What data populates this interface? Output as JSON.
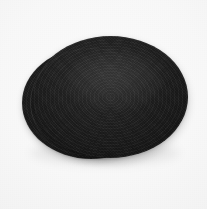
{
  "image": {
    "kind": "product-photo",
    "subject": "two stacked dark oval woven placemats",
    "caption": "",
    "background": {
      "description": "plain near-white studio backdrop",
      "color": "#f8f8f8",
      "edge_color": "#ededed"
    },
    "objects": [
      {
        "name": "lower placemat",
        "shape": "oval",
        "color": "#1e1e1e",
        "position": "behind, offset down-left",
        "visible_part": "left and lower-left rim"
      },
      {
        "name": "upper placemat",
        "shape": "oval",
        "color": "#232323",
        "position": "front, offset up-right",
        "visible_part": "full face"
      }
    ],
    "highlight": {
      "name": "specular sheen",
      "location": "upper-center of front placemat",
      "color": "#ffffff"
    },
    "shadow": {
      "name": "contact shadow",
      "color": "#000000"
    },
    "texture": "woven coiled fabric"
  }
}
